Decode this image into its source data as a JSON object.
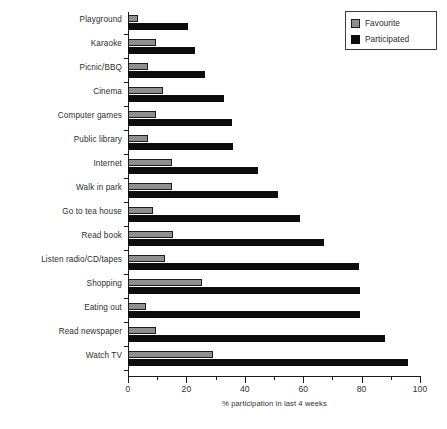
{
  "chart_data": {
    "type": "bar",
    "orientation": "horizontal",
    "title": "",
    "xlabel": "% participation in last 4 weeks",
    "ylabel": "",
    "xlim": [
      0,
      100
    ],
    "xticks": [
      0,
      20,
      40,
      60,
      80,
      100
    ],
    "xtick_labels": [
      "0",
      "20",
      "40",
      "60",
      "80",
      "100"
    ],
    "minor_xticks": [
      10,
      30,
      50,
      70,
      90
    ],
    "grid": false,
    "legend_position": "top-right",
    "categories": [
      "Playground",
      "Karaoke",
      "Picnic/BBQ",
      "Cinema",
      "Computer games",
      "Public library",
      "Internet",
      "Walk in park",
      "Go to tea house",
      "Read book",
      "Listen radio/CD/tapes",
      "Shopping",
      "Eating out",
      "Read newspaper",
      "Watch TV"
    ],
    "series": [
      {
        "name": "Favourite",
        "color": "#8f8f8f",
        "values": [
          3.5,
          9.5,
          7,
          12,
          9.5,
          7,
          15,
          15,
          8.5,
          15.5,
          12.5,
          25.5,
          6,
          9.5,
          29
        ]
      },
      {
        "name": "Participated",
        "color": "#0d0d0d",
        "values": [
          20.5,
          23,
          26.5,
          33,
          35.5,
          36,
          44.5,
          51.5,
          59,
          67,
          79,
          79.5,
          79.5,
          88,
          96
        ]
      }
    ]
  },
  "legend": {
    "items": [
      {
        "label": "Favourite",
        "color": "#8f8f8f"
      },
      {
        "label": "Participated",
        "color": "#0d0d0d"
      }
    ]
  }
}
